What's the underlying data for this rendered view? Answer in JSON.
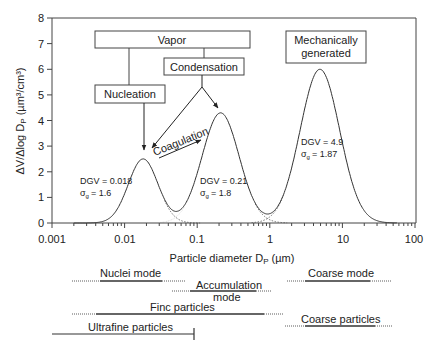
{
  "chart_data": {
    "type": "line",
    "title": "",
    "xlabel": "Particle diameter D_P (µm)",
    "ylabel": "ΔV/Δlog D_P (µm³/cm³)",
    "xscale": "log",
    "xlim": [
      0.001,
      100
    ],
    "ylim": [
      0,
      8
    ],
    "x_ticks": [
      "0.001",
      "0.01",
      "0.1",
      "1",
      "10",
      "100"
    ],
    "y_ticks": [
      "0",
      "1",
      "2",
      "3",
      "4",
      "5",
      "6",
      "7",
      "8"
    ],
    "grid": false,
    "series": [
      {
        "name": "Nuclei mode",
        "DGV": 0.018,
        "sigma_g": 1.6,
        "peak_y": 2.5
      },
      {
        "name": "Accumulation mode",
        "DGV": 0.21,
        "sigma_g": 1.8,
        "peak_y": 4.3
      },
      {
        "name": "Coarse mode",
        "DGV": 4.9,
        "sigma_g": 1.87,
        "peak_y": 6.0
      }
    ],
    "annotations": [
      {
        "text": "DGV = 0.018",
        "sub": "σg = 1.6"
      },
      {
        "text": "DGV = 0.21",
        "sub": "σg = 1.8"
      },
      {
        "text": "DGV = 4.9",
        "sub": "σg = 1.87"
      }
    ],
    "process_boxes": [
      "Vapor",
      "Condensation",
      "Nucleation",
      "Mechanically generated"
    ],
    "process_labels": [
      "Coagulation"
    ],
    "size_ranges": [
      {
        "label": "Nuclei mode",
        "row": 0
      },
      {
        "label": "Accumulation mode",
        "row": 1
      },
      {
        "label": "Coarse mode",
        "row": 0
      },
      {
        "label": "Finc particles",
        "row": 2
      },
      {
        "label": "Coarse particles",
        "row": 2
      },
      {
        "label": "Ultrafine particles",
        "row": 3
      }
    ]
  },
  "axis": {
    "ylabel_main": "ΔV/Δlog D",
    "ylabel_sub": "P",
    "ylabel_unit": " (µm³/cm³)",
    "xlabel_main": "Particle diameter D",
    "xlabel_sub": "P",
    "xlabel_unit": " (µm)",
    "xticks": [
      "0.001",
      "0.01",
      "0.1",
      "1",
      "10",
      "100"
    ],
    "yticks": [
      "0",
      "1",
      "2",
      "3",
      "4",
      "5",
      "6",
      "7",
      "8"
    ]
  },
  "boxes": {
    "vapor": "Vapor",
    "condensation": "Condensation",
    "nucleation": "Nucleation",
    "mech1": "Mechanically",
    "mech2": "generated",
    "coagulation": "Coagulation"
  },
  "modes": {
    "nuclei": {
      "dgv": "DGV = 0.018",
      "sig": "= 1.6"
    },
    "accum": {
      "dgv": "DGV = 0.21",
      "sig": "= 1.8"
    },
    "coarse": {
      "dgv": "DGV = 4.9",
      "sig": "= 1.87"
    },
    "sigma": "σ",
    "sigma_sub": "g"
  },
  "ranges": {
    "nuclei": "Nuclei mode",
    "accum1": "Accumulation",
    "accum2": "mode",
    "coarse_mode": "Coarse mode",
    "fine": "Finc particles",
    "coarse_particles": "Coarse particles",
    "ultrafine": "Ultrafine particles"
  }
}
